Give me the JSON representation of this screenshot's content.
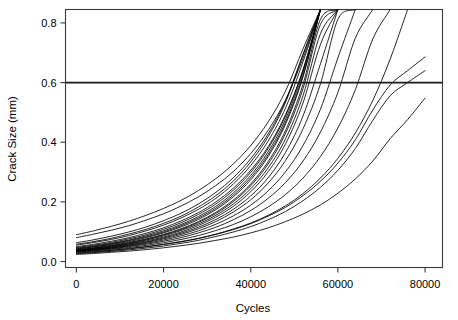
{
  "chart_data": {
    "type": "line",
    "title": "",
    "xlabel": "Cycles",
    "ylabel": "Crack Size (mm)",
    "xlim": [
      -2500,
      84000
    ],
    "ylim": [
      -0.02,
      0.845
    ],
    "xticks": [
      0,
      20000,
      40000,
      60000,
      80000
    ],
    "xticklabels": [
      "0",
      "20000",
      "40000",
      "60000",
      "80000"
    ],
    "yticks": [
      0.0,
      0.2,
      0.4,
      0.6,
      0.8
    ],
    "yticklabels": [
      "0.0",
      "0.2",
      "0.4",
      "0.6",
      "0.8"
    ],
    "grid": false,
    "legend": "none",
    "annotations": [
      {
        "name": "failure-threshold",
        "type": "hline",
        "y": 0.6,
        "label": "",
        "color": "#1a1a1a"
      }
    ],
    "x": [
      0,
      4000,
      8000,
      12000,
      16000,
      20000,
      24000,
      28000,
      32000,
      36000,
      40000,
      44000,
      48000,
      52000,
      56000,
      60000,
      64000,
      68000,
      72000,
      76000,
      80000
    ],
    "series": [
      {
        "name": "unit-1",
        "values": [
          0.09,
          0.103,
          0.118,
          0.135,
          0.155,
          0.178,
          0.205,
          0.238,
          0.278,
          0.327,
          0.389,
          0.468,
          0.572,
          0.713,
          0.845,
          null,
          null,
          null,
          null,
          null,
          null
        ]
      },
      {
        "name": "unit-2",
        "values": [
          0.08,
          0.092,
          0.105,
          0.12,
          0.139,
          0.16,
          0.186,
          0.217,
          0.255,
          0.302,
          0.362,
          0.44,
          0.542,
          0.682,
          0.845,
          null,
          null,
          null,
          null,
          null,
          null
        ]
      },
      {
        "name": "unit-3",
        "values": [
          0.063,
          0.073,
          0.085,
          0.099,
          0.116,
          0.137,
          0.162,
          0.193,
          0.232,
          0.281,
          0.345,
          0.428,
          0.54,
          0.694,
          0.845,
          null,
          null,
          null,
          null,
          null,
          null
        ]
      },
      {
        "name": "unit-4",
        "values": [
          0.058,
          0.067,
          0.078,
          0.092,
          0.108,
          0.128,
          0.152,
          0.183,
          0.221,
          0.27,
          0.334,
          0.419,
          0.534,
          0.694,
          0.845,
          null,
          null,
          null,
          null,
          null,
          null
        ]
      },
      {
        "name": "unit-5",
        "values": [
          0.055,
          0.064,
          0.074,
          0.087,
          0.103,
          0.122,
          0.146,
          0.175,
          0.212,
          0.26,
          0.322,
          0.404,
          0.515,
          0.67,
          0.845,
          null,
          null,
          null,
          null,
          null,
          null
        ]
      },
      {
        "name": "unit-6",
        "values": [
          0.05,
          0.058,
          0.068,
          0.08,
          0.095,
          0.113,
          0.136,
          0.164,
          0.2,
          0.246,
          0.306,
          0.385,
          0.493,
          0.642,
          0.845,
          null,
          null,
          null,
          null,
          null,
          null
        ]
      },
      {
        "name": "unit-7",
        "values": [
          0.047,
          0.055,
          0.064,
          0.076,
          0.09,
          0.108,
          0.13,
          0.158,
          0.193,
          0.239,
          0.299,
          0.379,
          0.489,
          0.643,
          0.845,
          null,
          null,
          null,
          null,
          null,
          null
        ]
      },
      {
        "name": "unit-8",
        "values": [
          0.045,
          0.052,
          0.061,
          0.072,
          0.086,
          0.103,
          0.124,
          0.151,
          0.185,
          0.23,
          0.289,
          0.368,
          0.478,
          0.634,
          0.845,
          null,
          null,
          null,
          null,
          null,
          null
        ]
      },
      {
        "name": "unit-9",
        "values": [
          0.043,
          0.05,
          0.059,
          0.07,
          0.083,
          0.099,
          0.12,
          0.146,
          0.179,
          0.223,
          0.281,
          0.359,
          0.468,
          0.624,
          0.845,
          null,
          null,
          null,
          null,
          null,
          null
        ]
      },
      {
        "name": "unit-10",
        "values": [
          0.042,
          0.049,
          0.057,
          0.067,
          0.08,
          0.096,
          0.116,
          0.141,
          0.174,
          0.217,
          0.274,
          0.352,
          0.461,
          0.619,
          0.845,
          null,
          null,
          null,
          null,
          null,
          null
        ]
      },
      {
        "name": "unit-11",
        "values": [
          0.04,
          0.046,
          0.054,
          0.064,
          0.076,
          0.091,
          0.11,
          0.134,
          0.165,
          0.206,
          0.26,
          0.335,
          0.44,
          0.594,
          0.812,
          0.845,
          null,
          null,
          null,
          null,
          null
        ]
      },
      {
        "name": "unit-12",
        "values": [
          0.039,
          0.045,
          0.053,
          0.062,
          0.074,
          0.089,
          0.107,
          0.131,
          0.161,
          0.201,
          0.254,
          0.327,
          0.43,
          0.58,
          0.795,
          0.845,
          null,
          null,
          null,
          null,
          null
        ]
      },
      {
        "name": "unit-13",
        "values": [
          0.038,
          0.044,
          0.051,
          0.06,
          0.072,
          0.086,
          0.104,
          0.126,
          0.155,
          0.193,
          0.244,
          0.314,
          0.412,
          0.556,
          0.764,
          0.845,
          null,
          null,
          null,
          null,
          null
        ]
      },
      {
        "name": "unit-14",
        "values": [
          0.037,
          0.042,
          0.049,
          0.058,
          0.069,
          0.082,
          0.099,
          0.121,
          0.149,
          0.185,
          0.234,
          0.301,
          0.395,
          0.532,
          0.728,
          0.845,
          null,
          null,
          null,
          null,
          null
        ]
      },
      {
        "name": "unit-15",
        "values": [
          0.036,
          0.041,
          0.048,
          0.056,
          0.066,
          0.079,
          0.095,
          0.115,
          0.141,
          0.175,
          0.22,
          0.281,
          0.366,
          0.488,
          0.663,
          0.845,
          null,
          null,
          null,
          null,
          null
        ]
      },
      {
        "name": "unit-16",
        "values": [
          0.035,
          0.04,
          0.046,
          0.054,
          0.064,
          0.076,
          0.091,
          0.11,
          0.134,
          0.166,
          0.207,
          0.263,
          0.339,
          0.445,
          0.596,
          0.812,
          0.845,
          null,
          null,
          null,
          null
        ]
      },
      {
        "name": "unit-17",
        "values": [
          0.034,
          0.039,
          0.045,
          0.052,
          0.061,
          0.072,
          0.086,
          0.103,
          0.125,
          0.153,
          0.189,
          0.237,
          0.301,
          0.389,
          0.511,
          0.683,
          0.845,
          null,
          null,
          null,
          null
        ]
      },
      {
        "name": "unit-18",
        "values": [
          0.033,
          0.038,
          0.043,
          0.05,
          0.058,
          0.068,
          0.08,
          0.096,
          0.115,
          0.14,
          0.171,
          0.212,
          0.265,
          0.337,
          0.434,
          0.567,
          0.749,
          0.845,
          null,
          null,
          null
        ]
      },
      {
        "name": "unit-19",
        "values": [
          0.032,
          0.036,
          0.041,
          0.047,
          0.054,
          0.063,
          0.074,
          0.087,
          0.104,
          0.124,
          0.15,
          0.183,
          0.225,
          0.28,
          0.352,
          0.448,
          0.576,
          0.746,
          0.845,
          null,
          null
        ]
      },
      {
        "name": "unit-20",
        "values": [
          0.03,
          0.034,
          0.038,
          0.044,
          0.05,
          0.058,
          0.067,
          0.078,
          0.092,
          0.109,
          0.129,
          0.155,
          0.187,
          0.228,
          0.28,
          0.346,
          0.431,
          0.54,
          0.679,
          0.845,
          null
        ]
      },
      {
        "name": "unit-21",
        "values": [
          0.024,
          0.027,
          0.031,
          0.035,
          0.04,
          0.046,
          0.053,
          0.061,
          0.071,
          0.082,
          0.096,
          0.113,
          0.134,
          0.159,
          0.19,
          0.229,
          0.277,
          0.337,
          0.412,
          0.476,
          0.548
        ]
      },
      {
        "name": "unit-22",
        "values": [
          0.028,
          0.032,
          0.037,
          0.042,
          0.049,
          0.057,
          0.066,
          0.077,
          0.091,
          0.107,
          0.127,
          0.152,
          0.182,
          0.221,
          0.269,
          0.33,
          0.408,
          0.508,
          0.592,
          0.64,
          0.686
        ]
      },
      {
        "name": "unit-23",
        "values": [
          0.026,
          0.03,
          0.034,
          0.039,
          0.045,
          0.052,
          0.061,
          0.071,
          0.084,
          0.099,
          0.117,
          0.14,
          0.168,
          0.204,
          0.249,
          0.306,
          0.379,
          0.473,
          0.556,
          0.6,
          0.64
        ]
      }
    ]
  },
  "figure": {
    "background": "#ffffff",
    "line_color": "#000000",
    "frame_color": "#3a3a3a"
  }
}
